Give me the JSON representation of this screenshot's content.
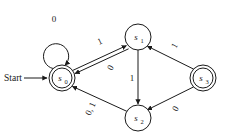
{
  "figure": {
    "kind": "finite-state-machine-diagram",
    "background_color": "#ffffff",
    "stroke_color": "#1a1a1a",
    "width": 238,
    "height": 140
  },
  "start": {
    "label": "Start",
    "target_state": "s0"
  },
  "states": [
    {
      "id": "s0",
      "base": "s",
      "subscript": "0",
      "accepting": true,
      "start": true,
      "cx": 62,
      "cy": 78,
      "r": 13
    },
    {
      "id": "s1",
      "base": "s",
      "subscript": "1",
      "accepting": false,
      "start": false,
      "cx": 138,
      "cy": 37,
      "r": 13
    },
    {
      "id": "s2",
      "base": "s",
      "subscript": "2",
      "accepting": false,
      "start": false,
      "cx": 138,
      "cy": 118,
      "r": 13
    },
    {
      "id": "s3",
      "base": "s",
      "subscript": "3",
      "accepting": true,
      "start": false,
      "cx": 203,
      "cy": 78,
      "r": 13
    }
  ],
  "transitions": [
    {
      "from": "s0",
      "to": "s0",
      "label": "0",
      "kind": "self-loop"
    },
    {
      "from": "s0",
      "to": "s1",
      "label": "1",
      "kind": "straight"
    },
    {
      "from": "s1",
      "to": "s0",
      "label": "0",
      "kind": "straight"
    },
    {
      "from": "s1",
      "to": "s2",
      "label": "1",
      "kind": "straight"
    },
    {
      "from": "s3",
      "to": "s1",
      "label": "1",
      "kind": "straight"
    },
    {
      "from": "s3",
      "to": "s2",
      "label": "0",
      "kind": "straight"
    },
    {
      "from": "s2",
      "to": "s0",
      "label": "0, 1",
      "kind": "straight"
    }
  ],
  "labels": {
    "selfloop_s0": "0",
    "s0_to_s1": "1",
    "s1_to_s0": "0",
    "s1_to_s2": "1",
    "s3_to_s1": "1",
    "s3_to_s2": "0",
    "s2_to_s0": "0, 1"
  }
}
